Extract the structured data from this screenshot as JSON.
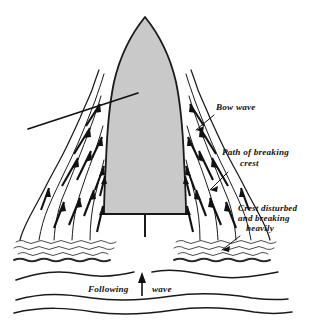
{
  "diagram": {
    "background_color": "#ffffff",
    "ink_color": "#111111",
    "hull_fill_color": "#c9c9c9",
    "view": "plan view of vessel from above with wake pattern"
  },
  "labels": {
    "bow_wave": "Bow wave",
    "path_of_breaking_line1": "Path of breaking",
    "path_of_breaking_line2": "crest",
    "crest_disturbed_line1": "Crest disturbed",
    "crest_disturbed_line2": "and breaking",
    "crest_disturbed_line3": "heavily",
    "following_left": "Following",
    "following_right": "wave"
  },
  "elements": {
    "hull_name": "ship-hull",
    "rudder_name": "rudder-wake",
    "left_wake": "left-wake-region",
    "right_wake": "right-wake-region",
    "bow_crest_line": "bow-crest-line",
    "following_wave_arrow": "following-wave-direction-arrow"
  },
  "counts": {
    "left_flow_arrows": 12,
    "right_flow_arrows": 12,
    "following_wave_lines": 3
  }
}
